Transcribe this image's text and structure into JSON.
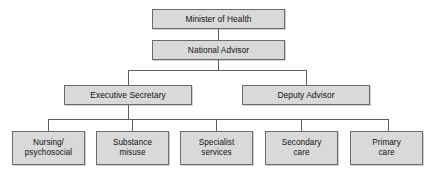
{
  "chart": {
    "type": "org-chart",
    "title": "",
    "background_color": "#ffffff",
    "node_fill_color": "#d9d9d9",
    "node_border_color": "#6b6b6b",
    "connector_color": "#5f5f5f",
    "text_color": "#111111",
    "levels": [
      {
        "level": 1,
        "nodes": [
          {
            "id": "minister-of-health",
            "label": "Minister of Health"
          }
        ]
      },
      {
        "level": 2,
        "nodes": [
          {
            "id": "national-advisor",
            "label": "National Advisor"
          }
        ]
      },
      {
        "level": 3,
        "nodes": [
          {
            "id": "executive-secretary",
            "label": "Executive Secretary"
          },
          {
            "id": "deputy-advisor",
            "label": "Deputy Advisor"
          }
        ]
      },
      {
        "level": 4,
        "nodes": [
          {
            "id": "nursing-psychosocial",
            "label": "Nursing/\npsychosocial"
          },
          {
            "id": "substance-misuse",
            "label": "Substance\nmisuse"
          },
          {
            "id": "specialist-services",
            "label": "Specialist\nservices"
          },
          {
            "id": "secondary-care",
            "label": "Secondary\ncare"
          },
          {
            "id": "primary-care",
            "label": "Primary\ncare"
          }
        ]
      }
    ],
    "edges": [
      {
        "from": "minister-of-health",
        "to": "national-advisor"
      },
      {
        "from": "national-advisor",
        "to": "executive-secretary"
      },
      {
        "from": "national-advisor",
        "to": "deputy-advisor"
      },
      {
        "from": "executive-secretary",
        "to": "nursing-psychosocial"
      },
      {
        "from": "executive-secretary",
        "to": "substance-misuse"
      },
      {
        "from": "executive-secretary",
        "to": "specialist-services"
      },
      {
        "from": "executive-secretary",
        "to": "secondary-care"
      },
      {
        "from": "executive-secretary",
        "to": "primary-care"
      }
    ]
  },
  "nodes": {
    "minister_of_health": "Minister of Health",
    "national_advisor": "National Advisor",
    "executive_secretary": "Executive Secretary",
    "deputy_advisor": "Deputy Advisor",
    "nursing_psychosocial": "Nursing/\npsychosocial",
    "substance_misuse": "Substance\nmisuse",
    "specialist_services": "Specialist\nservices",
    "secondary_care": "Secondary\ncare",
    "primary_care": "Primary\ncare"
  }
}
